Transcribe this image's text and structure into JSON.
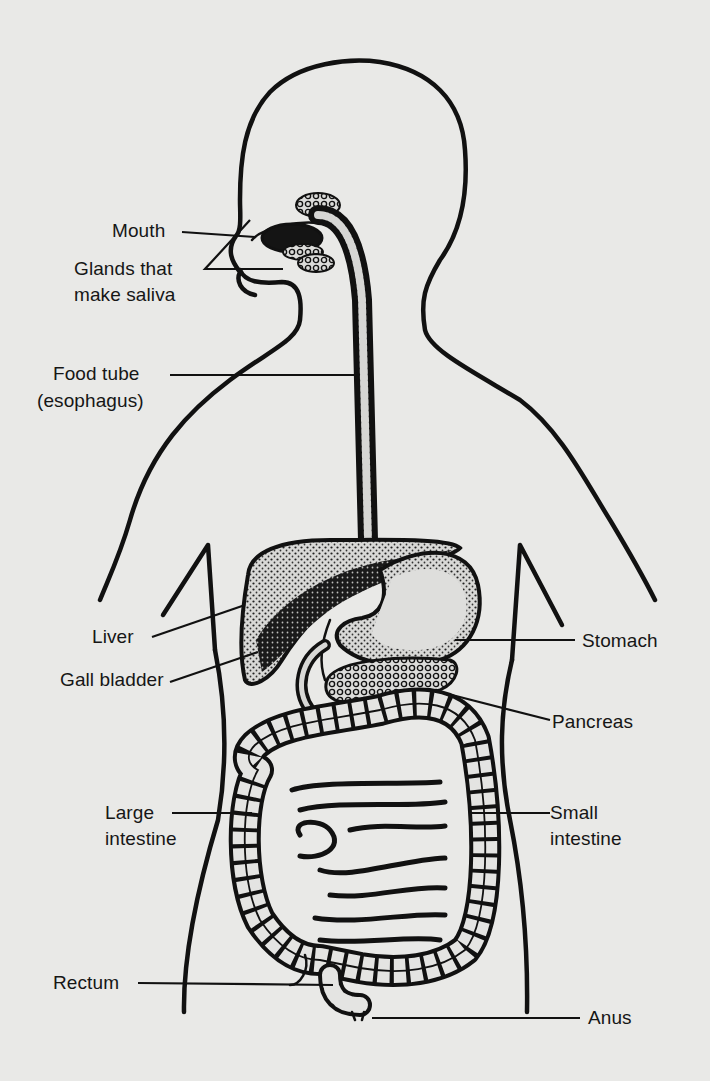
{
  "diagram": {
    "background_color": "#e9e9e7",
    "ink_color": "#111111",
    "labels": {
      "mouth": "Mouth",
      "glands_line1": "Glands that",
      "glands_line2": "make saliva",
      "food_tube_line1": "Food tube",
      "food_tube_line2": "(esophagus)",
      "liver": "Liver",
      "gall_bladder": "Gall bladder",
      "large_intestine_line1": "Large",
      "large_intestine_line2": "intestine",
      "rectum": "Rectum",
      "stomach": "Stomach",
      "pancreas": "Pancreas",
      "small_intestine_line1": "Small",
      "small_intestine_line2": "intestine",
      "anus": "Anus"
    }
  }
}
